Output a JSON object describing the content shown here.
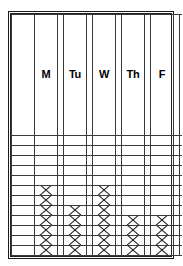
{
  "title_remnant": "",
  "chart_data": {
    "type": "bar",
    "title": "",
    "subtitle": "",
    "xlabel": "",
    "ylabel": "",
    "grid": true,
    "legend": null,
    "rows": 13,
    "ylim": [
      0,
      13
    ],
    "mark": "X",
    "orientation": "vertical",
    "stacking": "bottom-aligned",
    "categories": [
      "M",
      "Tu",
      "W",
      "Th",
      "F"
    ],
    "values": [
      7,
      5,
      7,
      4,
      4
    ],
    "series": [
      {
        "name": "tally",
        "values": [
          7,
          5,
          7,
          4,
          4
        ]
      }
    ],
    "columns": [
      {
        "id": "label",
        "label": "",
        "kind": "label",
        "count": 0
      },
      {
        "id": "mon",
        "label": "M",
        "kind": "day",
        "count": 7
      },
      {
        "id": "tue",
        "label": "Tu",
        "kind": "day",
        "count": 5
      },
      {
        "id": "wed",
        "label": "W",
        "kind": "day",
        "count": 7
      },
      {
        "id": "thu",
        "label": "Th",
        "kind": "day",
        "count": 4
      },
      {
        "id": "fri",
        "label": "F",
        "kind": "day",
        "count": 4
      },
      {
        "id": "tail",
        "label": "",
        "kind": "tail",
        "count": 0
      }
    ]
  }
}
